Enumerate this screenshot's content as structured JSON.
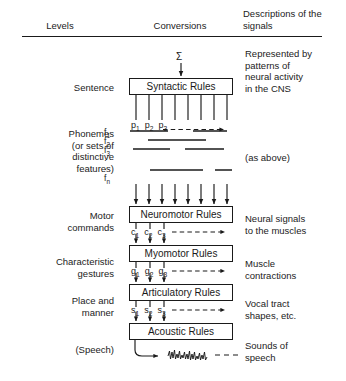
{
  "header": {
    "levels": "Levels",
    "conversions": "Conversions",
    "descriptions": "Descriptions\nof the signals"
  },
  "levels": [
    {
      "id": "sentence",
      "label": "Sentence"
    },
    {
      "id": "phonemes",
      "label": "Phonemes\n(or sets of\ndistinctive\nfeatures)"
    },
    {
      "id": "motor-commands",
      "label": "Motor\ncommands"
    },
    {
      "id": "characteristic-gestures",
      "label": "Characteristic\ngestures"
    },
    {
      "id": "place-and-manner",
      "label": "Place and\nmanner"
    },
    {
      "id": "speech",
      "label": "(Speech)"
    }
  ],
  "boxes": [
    {
      "id": "syntactic-rules",
      "label": "Syntactic Rules"
    },
    {
      "id": "neuromotor-rules",
      "label": "Neuromotor Rules"
    },
    {
      "id": "myomotor-rules",
      "label": "Myomotor Rules"
    },
    {
      "id": "articulatory-rules",
      "label": "Articulatory Rules"
    },
    {
      "id": "acoustic-rules",
      "label": "Acoustic Rules"
    }
  ],
  "descriptions": [
    {
      "id": "sentence-desc",
      "text": "Represented by\npatterns of\nneural activity\nin the CNS"
    },
    {
      "id": "phonemes-desc",
      "text": "(as above)"
    },
    {
      "id": "motor-desc",
      "text": "Neural signals\nto the muscles"
    },
    {
      "id": "gestures-desc",
      "text": "Muscle\ncontractions"
    },
    {
      "id": "place-desc",
      "text": "Vocal tract\nshapes, etc."
    },
    {
      "id": "speech-desc",
      "text": "Sounds of\nspeech"
    }
  ],
  "symbols": {
    "sigma": "Σ"
  },
  "signal_rows": [
    {
      "id": "phoneme-row",
      "items": [
        "p",
        "p",
        "p"
      ],
      "subscripts": [
        "1",
        "2",
        "3"
      ],
      "trailing": "dashed-arrow"
    },
    {
      "id": "motor-command-row",
      "items": [
        "c",
        "c",
        "c"
      ],
      "subscripts": [
        "1",
        "2",
        "3"
      ],
      "trailing": "dashed-arrow"
    },
    {
      "id": "gesture-row",
      "items": [
        "g",
        "g",
        "g"
      ],
      "subscripts": [
        "1",
        "2",
        "3"
      ],
      "trailing": "dashed-arrow"
    },
    {
      "id": "place-manner-row",
      "items": [
        "s",
        "s",
        "s"
      ],
      "subscripts": [
        "1",
        "2",
        "3"
      ],
      "trailing": "dashed-arrow"
    }
  ],
  "feature_labels": [
    {
      "base": "f",
      "sub": "1"
    },
    {
      "base": "f",
      "sub": "2"
    },
    {
      "base": "f",
      "sub": "3"
    },
    {
      "base": "·",
      "sub": ""
    },
    {
      "base": "·",
      "sub": ""
    },
    {
      "base": "f",
      "sub": "n"
    }
  ],
  "colors": {
    "ink": "#1a1a1a",
    "text": "#222222",
    "background": "#ffffff"
  }
}
